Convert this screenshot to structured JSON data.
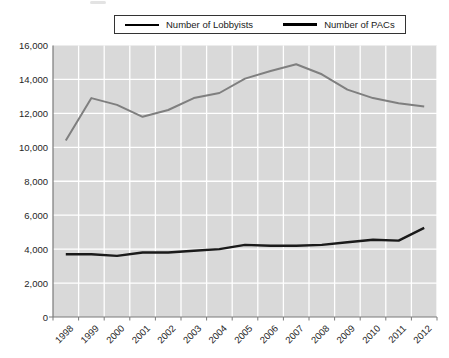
{
  "legend": {
    "items": [
      {
        "label": "Number of Lobbyists",
        "color": "#7f7f7f"
      },
      {
        "label": "Number of PACs",
        "color": "#1a1a1a"
      }
    ]
  },
  "chart_data": {
    "type": "line",
    "title": "",
    "xlabel": "",
    "ylabel": "",
    "categories": [
      "1998",
      "1999",
      "2000",
      "2001",
      "2002",
      "2003",
      "2004",
      "2005",
      "2006",
      "2007",
      "2008",
      "2009",
      "2010",
      "2011",
      "2012"
    ],
    "series": [
      {
        "name": "Number of Lobbyists",
        "color": "#7f7f7f",
        "stroke_width": 2,
        "values": [
          10400,
          12900,
          12500,
          11800,
          12200,
          12900,
          13200,
          14050,
          14500,
          14900,
          14300,
          13400,
          12900,
          12600,
          12400
        ]
      },
      {
        "name": "Number of PACs",
        "color": "#1a1a1a",
        "stroke_width": 2.4,
        "values": [
          3700,
          3700,
          3600,
          3800,
          3800,
          3900,
          4000,
          4250,
          4200,
          4200,
          4250,
          4400,
          4550,
          4500,
          5250
        ]
      }
    ],
    "ylim": [
      0,
      16000
    ],
    "y_ticks": [
      0,
      2000,
      4000,
      6000,
      8000,
      10000,
      12000,
      14000,
      16000
    ],
    "y_tick_labels": [
      "0",
      "2,000",
      "4,000",
      "6,000",
      "8,000",
      "10,000",
      "12,000",
      "14,000",
      "16,000"
    ],
    "grid": "on",
    "plot_bg_color": "#d9d9d9",
    "grid_color": "#ffffff",
    "axis_line_color": "#7a7a7a",
    "tick_label_color": "#262626",
    "legend_position": "top-center"
  }
}
